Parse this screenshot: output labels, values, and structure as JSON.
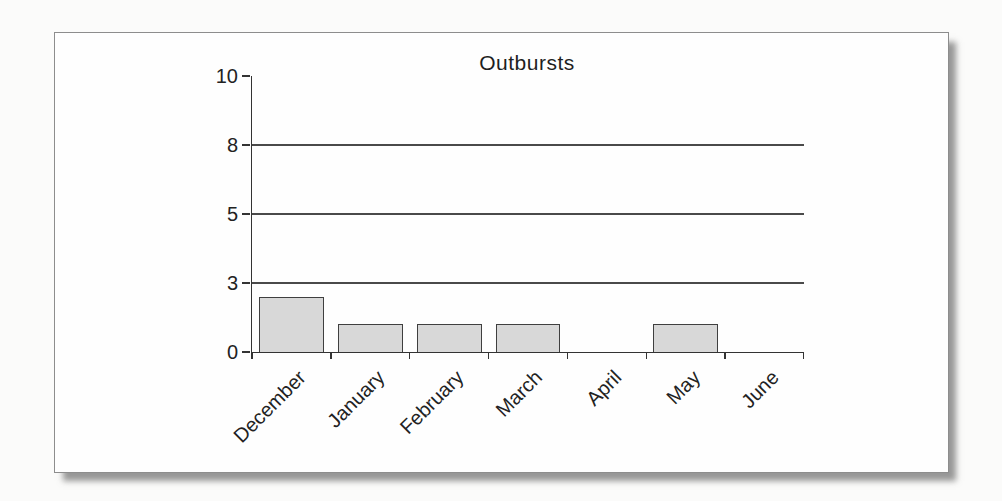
{
  "chart_data": {
    "type": "bar",
    "title": "Outbursts",
    "categories": [
      "December",
      "January",
      "February",
      "March",
      "April",
      "May",
      "June"
    ],
    "values": [
      2.4,
      1.2,
      1.2,
      1.2,
      0,
      1.2,
      0
    ],
    "y_ticks": [
      0,
      3,
      5,
      8,
      10
    ],
    "gridline_ticks": [
      3,
      5,
      8
    ],
    "y_tick_spacing": "equal-intervals",
    "ylim": [
      0,
      10
    ],
    "xlabel": "",
    "ylabel": "",
    "legend": "none",
    "colors": {
      "bar_fill": "#d8d8d8",
      "bar_border": "#3f3f3f",
      "axis": "#333333",
      "gridline": "#4a4a4a",
      "text": "#222222",
      "card_background": "#fefefe",
      "page_background": "#fbfbfa"
    }
  }
}
